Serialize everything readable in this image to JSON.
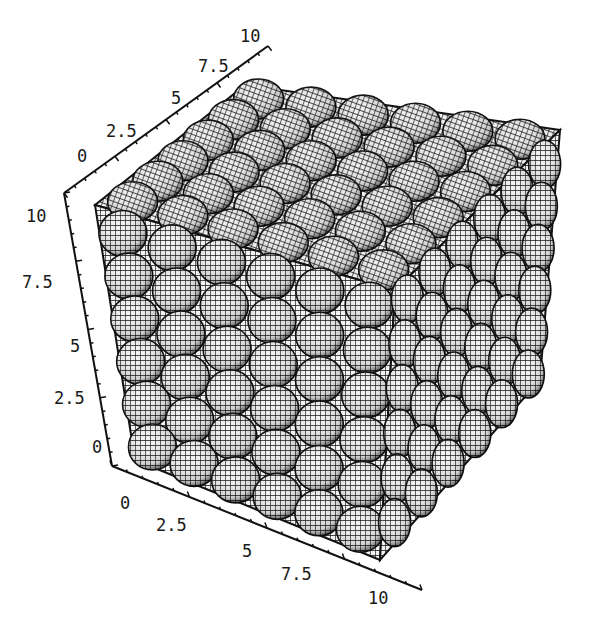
{
  "chart_data": {
    "type": "3d-surface",
    "title": "",
    "grid_spheres_per_edge": 6,
    "axes": {
      "x": {
        "label": "",
        "range": [
          0,
          10
        ],
        "ticks": [
          "0",
          "2.5",
          "5",
          "7.5",
          "10"
        ],
        "position": "bottom-front"
      },
      "y": {
        "label": "",
        "range": [
          0,
          10
        ],
        "ticks": [
          "0",
          "2.5",
          "5",
          "7.5",
          "10"
        ],
        "position": "top-back"
      },
      "z": {
        "label": "",
        "range": [
          0,
          10
        ],
        "ticks": [
          "0",
          "2.5",
          "5",
          "7.5",
          "10"
        ],
        "position": "left-vertical"
      }
    },
    "colors": {
      "mesh": "#111111",
      "fill": "#f4f4f4",
      "shadow": "#0a0a0a",
      "background": "#ffffff"
    }
  },
  "labels": {
    "top_axis": [
      "0",
      "2.5",
      "5",
      "7.5",
      "10"
    ],
    "left_axis": [
      "10",
      "7.5",
      "5",
      "2.5",
      "0"
    ],
    "bottom_axis": [
      "0",
      "2.5",
      "5",
      "7.5",
      "10"
    ]
  }
}
